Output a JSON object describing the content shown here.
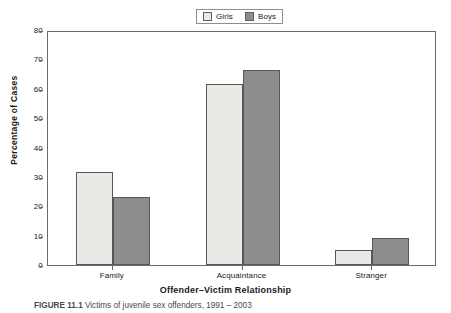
{
  "chart_data": {
    "type": "bar",
    "title": "",
    "xlabel": "Offender–Victim Relationship",
    "ylabel": "Percentage of Cases",
    "categories": [
      "Family",
      "Acquaintance",
      "Stranger"
    ],
    "series": [
      {
        "name": "Girls",
        "values": [
          31.6,
          61.6,
          5.0
        ],
        "color": "#e9e9e5"
      },
      {
        "name": "Boys",
        "values": [
          23.1,
          66.3,
          9.3
        ],
        "color": "#8d8d8d"
      }
    ],
    "ylim": [
      0,
      80
    ],
    "yticks": [
      0,
      10,
      20,
      30,
      40,
      50,
      60,
      70,
      80
    ],
    "ytick_labels": [
      "0",
      "10",
      "20",
      "30",
      "40",
      "50",
      "60",
      "70",
      "80"
    ],
    "grid": false,
    "legend_position": "top-center"
  },
  "legend": {
    "entries": [
      {
        "label": "Girls",
        "swatch": "#e9e9e5"
      },
      {
        "label": "Boys",
        "swatch": "#8d8d8d"
      }
    ]
  },
  "axes": {
    "y_title": "Percentage of Cases",
    "x_title": "Offender–Victim Relationship"
  },
  "caption": {
    "figure_number": "FIGURE 11.1",
    "text": "Victims of juvenile sex offenders, 1991 – 2003"
  }
}
